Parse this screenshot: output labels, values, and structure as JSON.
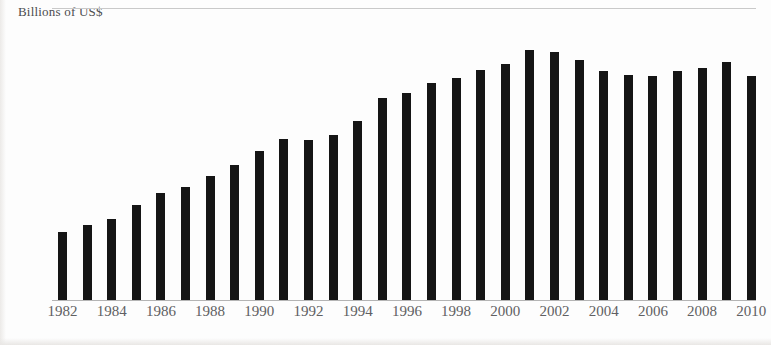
{
  "chart_data": {
    "type": "bar",
    "title": "Billions of US$",
    "xlabel": "",
    "ylabel": "Billions of US$",
    "ylim": [
      0,
      55
    ],
    "grid": true,
    "legend": null,
    "ytick_labels": [
      "10",
      "20",
      "30",
      "40"
    ],
    "yticks": [
      10,
      20,
      30,
      40,
      50
    ],
    "xtick_labels": [
      "1982",
      "1984",
      "1986",
      "1988",
      "1990",
      "1992",
      "1994",
      "1996",
      "1998",
      "2000",
      "2002",
      "2004",
      "2006",
      "2008",
      "2010"
    ],
    "bar_color": "#151515",
    "grid_color": "#c9c9c9",
    "categories": [
      "1982",
      "1983",
      "1984",
      "1985",
      "1986",
      "1987",
      "1988",
      "1989",
      "1990",
      "1991",
      "1992",
      "1993",
      "1994",
      "1995",
      "1996",
      "1997",
      "1998",
      "1999",
      "2000",
      "2001",
      "2002",
      "2003",
      "2004",
      "2005",
      "2006",
      "2007",
      "2008",
      "2009",
      "2010"
    ],
    "values": [
      14.8,
      16.2,
      17.6,
      20.5,
      23.1,
      24.3,
      26.8,
      29.1,
      32.1,
      34.7,
      34.4,
      35.4,
      38.4,
      43.4,
      44.5,
      46.5,
      47.7,
      49.4,
      50.6,
      53.7,
      53.2,
      51.6,
      49.2,
      48.3,
      48.1,
      49.1,
      49.8,
      51.0,
      48.1
    ]
  },
  "header": {
    "axis_title": "Billions of US$"
  }
}
